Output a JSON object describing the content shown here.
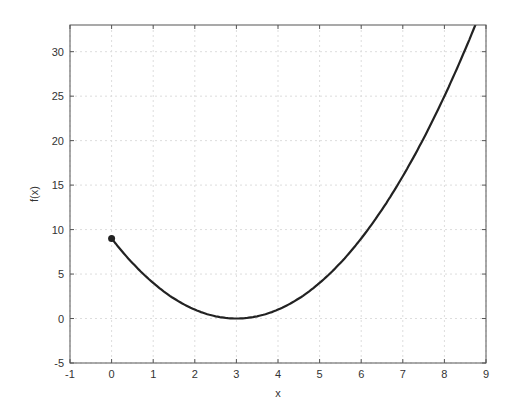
{
  "chart_data": {
    "type": "line",
    "title": "",
    "xlabel": "x",
    "ylabel": "f(x)",
    "xlim": [
      -1,
      9
    ],
    "ylim": [
      -5,
      33
    ],
    "xticks": [
      -1,
      0,
      1,
      2,
      3,
      4,
      5,
      6,
      7,
      8,
      9
    ],
    "yticks": [
      -5,
      0,
      5,
      10,
      15,
      20,
      25,
      30
    ],
    "grid": true,
    "legend": null,
    "series": [
      {
        "name": "f(x) = (x-3)^2",
        "x": [
          0,
          0.5,
          1,
          1.5,
          2,
          2.5,
          3,
          3.5,
          4,
          4.5,
          5,
          5.5,
          6,
          6.5,
          7,
          7.5,
          8,
          8.5,
          8.75
        ],
        "values": [
          9,
          6.25,
          4,
          2.25,
          1,
          0.25,
          0,
          0.25,
          1,
          2.25,
          4,
          6.25,
          9,
          12.25,
          16,
          20.25,
          25,
          30.25,
          33.06
        ],
        "color": "#222222"
      }
    ],
    "annotations": [
      {
        "type": "marker",
        "x": 0,
        "y": 9,
        "shape": "filled-circle"
      }
    ]
  },
  "colors": {
    "line": "#222222",
    "axis": "#555555",
    "grid": "#dddddd",
    "text": "#333333"
  }
}
